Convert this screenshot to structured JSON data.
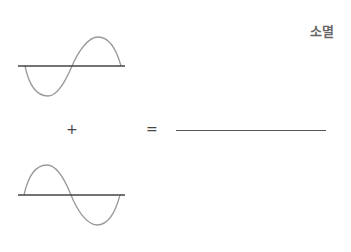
{
  "diagram": {
    "result_label": "소멸",
    "operator_plus": "+",
    "operator_equals": "=",
    "colors": {
      "axis": "#444444",
      "wave": "#9a9a9a",
      "result_line": "#555555",
      "label": "#666666"
    },
    "waves": [
      {
        "name": "wave-1",
        "phase": "inverted-start (trough first)"
      },
      {
        "name": "wave-2",
        "phase": "normal-start (peak first)"
      }
    ],
    "result": "flat line (destructive interference)"
  }
}
